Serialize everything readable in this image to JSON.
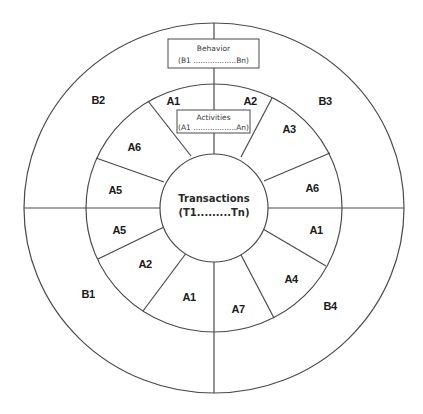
{
  "diagram": {
    "center": {
      "title": "Transactions",
      "subtitle": "(T1.........Tn)"
    },
    "behavior_box": {
      "title": "Behavior",
      "range": "(B1 ..................Bn)"
    },
    "activities_box": {
      "title": "Activities",
      "range": "(A1 ..................An)"
    },
    "behavior_labels": {
      "top_left": "B2",
      "top_right": "B3",
      "bottom_left": "B1",
      "bottom_right": "B4"
    },
    "activity_labels": [
      {
        "id": "a-top-left",
        "text": "A1"
      },
      {
        "id": "a-top-right",
        "text": "A2"
      },
      {
        "id": "a-right-upper",
        "text": "A3"
      },
      {
        "id": "a-left-upper",
        "text": "A6"
      },
      {
        "id": "a-right-mid-upper",
        "text": "A6"
      },
      {
        "id": "a-left-mid-upper",
        "text": "A5"
      },
      {
        "id": "a-left-mid-lower",
        "text": "A5"
      },
      {
        "id": "a-right-mid-lower",
        "text": "A1"
      },
      {
        "id": "a-left-lower",
        "text": "A2"
      },
      {
        "id": "a-right-lower",
        "text": "A4"
      },
      {
        "id": "a-bottom-left",
        "text": "A1"
      },
      {
        "id": "a-bottom-right",
        "text": "A7"
      }
    ],
    "colors": {
      "line": "#4a4a4a",
      "text": "#1a1a1a",
      "background": "#ffffff"
    }
  }
}
